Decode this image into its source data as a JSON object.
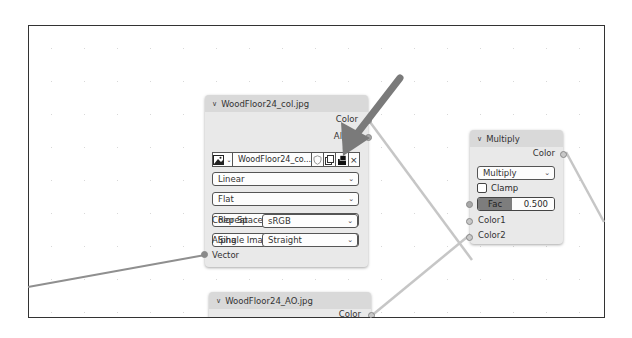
{
  "image_texture_node": {
    "title": "WoodFloor24_col.jpg",
    "outputs": [
      "Color",
      "Alpha"
    ],
    "image_name": "WoodFloor24_co...",
    "interpolation": "Linear",
    "projection": "Flat",
    "extension": "Repeat",
    "source": "Single Image",
    "color_space_label": "Color Space",
    "color_space_value": "sRGB",
    "alpha_label": "Alpha",
    "alpha_value": "Straight",
    "input": "Vector",
    "icons": {
      "image_type": "image-icon",
      "fake_user": "shield-icon",
      "duplicate": "copy-icon",
      "pack": "pack-icon",
      "close": "×"
    }
  },
  "multiply_node": {
    "title": "Multiply",
    "output": "Color",
    "blend_mode": "Multiply",
    "clamp_label": "Clamp",
    "fac_label": "Fac",
    "fac_value": "0.500",
    "inputs": [
      "Color1",
      "Color2"
    ]
  },
  "ao_node": {
    "title": "WoodFloor24_AO.jpg",
    "output": "Color"
  },
  "annotation": {
    "arrow_color": "#7a7a7a",
    "points_to": "pack-icon"
  },
  "glyphs": {
    "chevron": "⌄",
    "collapse": "∨"
  }
}
